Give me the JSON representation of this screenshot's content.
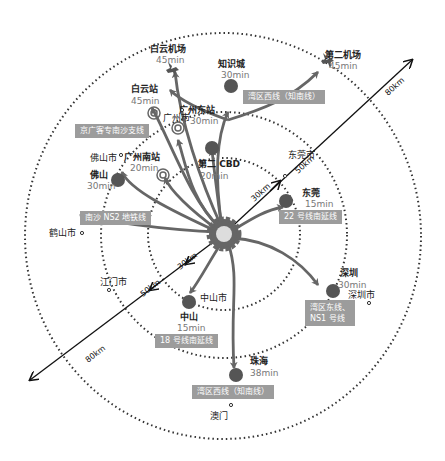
{
  "rings": [
    {
      "label": "30km",
      "radius_px": 76
    },
    {
      "label": "50km",
      "radius_px": 123
    },
    {
      "label": "80km",
      "radius_px": 200
    }
  ],
  "colors": {
    "node": "#555555",
    "arrow": "#666666",
    "tag_bg": "#9c9c9c",
    "ring": "#333333"
  },
  "nodes": {
    "baiyun_airport": {
      "name": "白云机场",
      "time": "45min"
    },
    "zhishicheng": {
      "name": "知识城",
      "time": "30min"
    },
    "second_airport": {
      "name": "第二机场",
      "time": "45min"
    },
    "baiyun_station": {
      "name": "白云站",
      "time": "45min"
    },
    "guangzhou_east": {
      "name": "广州东站",
      "time": "30min"
    },
    "guangzhou_city": {
      "name": "广州市"
    },
    "guangzhou_south": {
      "name": "广州南站",
      "time": "20min"
    },
    "foshan_city": {
      "name": "佛山市"
    },
    "foshan": {
      "name": "佛山",
      "time": "30min"
    },
    "second_cbd": {
      "name": "第二 CBD",
      "time": "20min"
    },
    "dongguan_city": {
      "name": "东莞市"
    },
    "dongguan": {
      "name": "东莞",
      "time": "15min"
    },
    "heshan_city": {
      "name": "鹤山市"
    },
    "jiangmen_city": {
      "name": "江门市"
    },
    "shenzhen": {
      "name": "深圳",
      "time": "30min"
    },
    "shenzhen_city": {
      "name": "深圳市"
    },
    "zhongshan_city": {
      "name": "中山市"
    },
    "zhongshan": {
      "name": "中山",
      "time": "15min"
    },
    "zhuhai": {
      "name": "珠海",
      "time": "38min"
    },
    "macau": {
      "name": "澳门"
    }
  },
  "tags": {
    "west_line_top": "湾区西线（知南线）",
    "jinggang": "京广客专南沙支线",
    "ns2": "南沙 NS2 地铁线",
    "line22": "22 号线南延线",
    "east_line_1": "湾区东线、",
    "east_line_2": "NS1 号线",
    "line18": "18 号线南延线",
    "west_line_bottom": "湾区西线（知南线）"
  }
}
